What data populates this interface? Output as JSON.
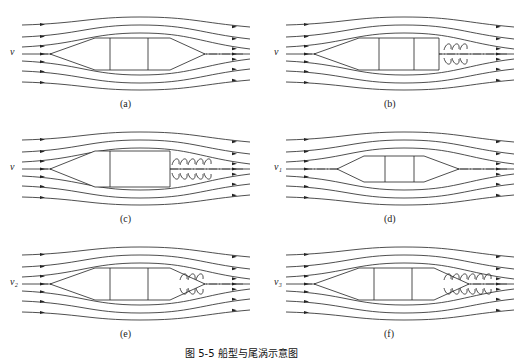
{
  "figure": {
    "caption": "图 5-5  船型与尾涡示意图",
    "panels": [
      {
        "id": "a",
        "label": "(a)",
        "velocity": "v",
        "hull": "pointed-stern",
        "vortex_rows": 0
      },
      {
        "id": "b",
        "label": "(b)",
        "velocity": "v",
        "hull": "truncated-stern",
        "vortex_rows": 3
      },
      {
        "id": "c",
        "label": "(c)",
        "velocity": "v",
        "hull": "blunt-stern",
        "vortex_rows": 5
      },
      {
        "id": "d",
        "label": "(d)",
        "velocity": "v₁",
        "hull": "small-pointed",
        "vortex_rows": 0
      },
      {
        "id": "e",
        "label": "(e)",
        "velocity": "v₂",
        "hull": "pointed-stern",
        "vortex_rows": 3
      },
      {
        "id": "f",
        "label": "(f)",
        "velocity": "v₃",
        "hull": "pointed-stern",
        "vortex_rows": 6
      }
    ]
  },
  "colors": {
    "line": "#222222",
    "background": "#ffffff"
  }
}
